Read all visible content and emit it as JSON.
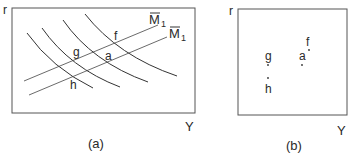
{
  "panel_a": {
    "caption": "(a)",
    "y_axis_label": "r",
    "x_axis_label": "Y",
    "line_labels": {
      "upper": "M",
      "upper_sub": "1",
      "lower": "M",
      "lower_sub": "1"
    },
    "point_labels": {
      "f": "f",
      "g": "g",
      "a": "a",
      "h": "h"
    },
    "curve_count": 4
  },
  "panel_b": {
    "caption": "(b)",
    "y_axis_label": "r",
    "x_axis_label": "Y",
    "points": [
      {
        "label": "f"
      },
      {
        "label": "g"
      },
      {
        "label": "a"
      },
      {
        "label": "h"
      }
    ]
  },
  "colors": {
    "ink": "#2a2a2a",
    "frame": "#555555"
  }
}
